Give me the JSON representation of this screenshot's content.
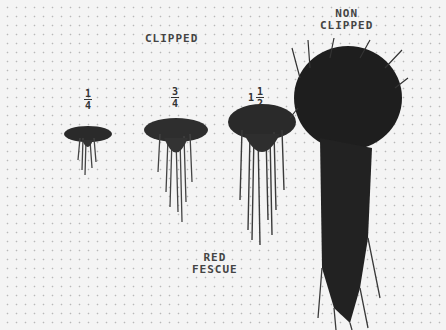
{
  "photo": {
    "header_label": "CLIPPED",
    "specimens": [
      {
        "label_whole": "",
        "label_num": "1",
        "label_den": "4"
      },
      {
        "label_whole": "",
        "label_num": "3",
        "label_den": "4"
      },
      {
        "label_whole": "1",
        "label_num": "1",
        "label_den": "2"
      },
      {
        "label_line1": "NON",
        "label_line2": "CLIPPED"
      }
    ],
    "caption_line1": "RED",
    "caption_line2": "FESCUE"
  }
}
